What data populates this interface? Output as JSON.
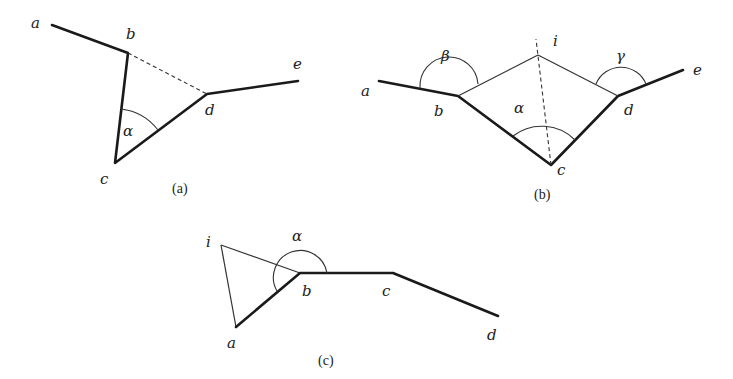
{
  "figure": {
    "panels": [
      {
        "id": "a",
        "caption": "(a)",
        "caption_pos": [
          183,
          193
        ],
        "vertices": {
          "a": {
            "label": "a",
            "point": [
              52,
              25
            ],
            "label_pos": [
              31,
              28
            ]
          },
          "b": {
            "label": "b",
            "point": [
              128,
              53
            ],
            "label_pos": [
              126,
              39
            ]
          },
          "c": {
            "label": "c",
            "point": [
              115,
              163
            ],
            "label_pos": [
              100,
              184
            ]
          },
          "d": {
            "label": "d",
            "point": [
              207,
              94
            ],
            "label_pos": [
              205,
              115
            ]
          },
          "e": {
            "label": "e",
            "point": [
              298,
              81
            ],
            "label_pos": [
              293,
              69
            ]
          }
        },
        "angles": [
          {
            "label": "α",
            "at": "c",
            "label_pos": [
              123,
              136
            ]
          }
        ],
        "edges": {
          "thick": [
            [
              "a",
              "b"
            ],
            [
              "b",
              "c"
            ],
            [
              "c",
              "d"
            ],
            [
              "d",
              "e"
            ]
          ],
          "dashed": [
            [
              "b",
              "d"
            ]
          ]
        }
      },
      {
        "id": "b",
        "caption": "(b)",
        "caption_pos": [
          545,
          199
        ],
        "vertices": {
          "a": {
            "label": "a",
            "point": [
              379,
              81
            ],
            "label_pos": [
              361,
              96
            ]
          },
          "b": {
            "label": "b",
            "point": [
              458,
              96
            ],
            "label_pos": [
              434,
              116
            ]
          },
          "c": {
            "label": "c",
            "point": [
              551,
              165
            ],
            "label_pos": [
              557,
              175
            ]
          },
          "d": {
            "label": "d",
            "point": [
              618,
              96
            ],
            "label_pos": [
              624,
              115
            ]
          },
          "e": {
            "label": "e",
            "point": [
              683,
              70
            ],
            "label_pos": [
              693,
              75
            ]
          },
          "i": {
            "label": "i",
            "point": [
              538,
              55
            ],
            "label_pos": [
              553,
              46
            ]
          }
        },
        "angles": [
          {
            "label": "β",
            "at": "b",
            "label_pos": [
              441,
              61
            ]
          },
          {
            "label": "α",
            "at": "c",
            "label_pos": [
              514,
              113
            ]
          },
          {
            "label": "γ",
            "at": "d",
            "label_pos": [
              616,
              61
            ]
          }
        ],
        "edges": {
          "thick": [
            [
              "a",
              "b"
            ],
            [
              "b",
              "c"
            ],
            [
              "c",
              "d"
            ],
            [
              "d",
              "e"
            ]
          ],
          "thin": [
            [
              "b",
              "i"
            ],
            [
              "i",
              "d"
            ]
          ],
          "dashed": [
            [
              "c",
              "i"
            ]
          ]
        }
      },
      {
        "id": "c",
        "caption": "(c)",
        "caption_pos": [
          329,
          365
        ],
        "vertices": {
          "i": {
            "label": "i",
            "point": [
              221,
              245
            ],
            "label_pos": [
              206,
              247
            ]
          },
          "a": {
            "label": "a",
            "point": [
              236,
              327
            ],
            "label_pos": [
              227,
              348
            ]
          },
          "b": {
            "label": "b",
            "point": [
              300,
              273
            ],
            "label_pos": [
              302,
              296
            ]
          },
          "c": {
            "label": "c",
            "point": [
              393,
              273
            ],
            "label_pos": [
              382,
              296
            ]
          },
          "d": {
            "label": "d",
            "point": [
              498,
              316
            ],
            "label_pos": [
              487,
              340
            ]
          }
        },
        "angles": [
          {
            "label": "α",
            "at": "b",
            "label_pos": [
              292,
              241
            ]
          }
        ],
        "edges": {
          "thick": [
            [
              "a",
              "b"
            ],
            [
              "b",
              "c"
            ],
            [
              "c",
              "d"
            ]
          ],
          "thin": [
            [
              "i",
              "a"
            ],
            [
              "i",
              "b"
            ]
          ]
        }
      }
    ]
  }
}
